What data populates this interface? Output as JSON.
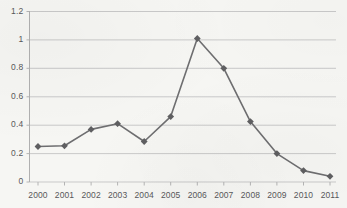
{
  "chart_data": {
    "type": "line",
    "title": "",
    "subtitle": "",
    "xlabel": "",
    "ylabel": "",
    "categories": [
      "2000",
      "2001",
      "2002",
      "2003",
      "2004",
      "2005",
      "2006",
      "2007",
      "2008",
      "2009",
      "2010",
      "2011"
    ],
    "values": [
      0.25,
      0.255,
      0.37,
      0.41,
      0.285,
      0.46,
      1.01,
      0.8,
      0.425,
      0.2,
      0.08,
      0.04
    ],
    "series": [
      {
        "name": "series-1",
        "values": [
          0.25,
          0.255,
          0.37,
          0.41,
          0.285,
          0.46,
          1.01,
          0.8,
          0.425,
          0.2,
          0.08,
          0.04
        ]
      }
    ],
    "ylim": [
      0,
      1.2
    ],
    "yticks": [
      "0",
      "0.2",
      "0.4",
      "0.6",
      "0.8",
      "1",
      "1.2"
    ],
    "ytick_values": [
      0,
      0.2,
      0.4,
      0.6,
      0.8,
      1,
      1.2
    ],
    "xticks": [
      "2000",
      "2001",
      "2002",
      "2003",
      "2004",
      "2005",
      "2006",
      "2007",
      "2008",
      "2009",
      "2010",
      "2011"
    ],
    "grid": "horizontal",
    "legend": "none",
    "marker": "diamond",
    "colors": {
      "line": "#6e6e70",
      "marker": "#5f5f61",
      "grid": "#c9c9c9",
      "axis": "#b4b4b4",
      "tick_label": "#58585a",
      "background": "#f6f6f3"
    }
  }
}
